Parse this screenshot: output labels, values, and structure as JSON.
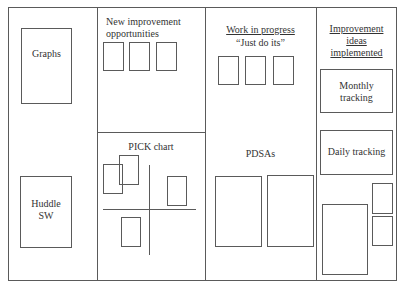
{
  "board": {
    "columns": [
      {
        "id": "col-1",
        "sections": [
          {
            "label": "Graphs"
          },
          {
            "label": "Huddle SW",
            "lines": [
              "Huddle",
              "SW"
            ]
          }
        ]
      },
      {
        "id": "col-2",
        "top": {
          "title_lines": [
            "New improvement",
            "opportunities"
          ],
          "card_count": 3
        },
        "bottom": {
          "title": "PICK chart",
          "card_count": 4
        }
      },
      {
        "id": "col-3",
        "top": {
          "title": "Work in progress",
          "subtitle": "“Just do its”",
          "card_count": 3
        },
        "bottom": {
          "title": "PDSAs",
          "card_count": 2
        }
      },
      {
        "id": "col-4",
        "title_lines": [
          "Improvement",
          "ideas",
          "implemented"
        ],
        "boxes": [
          {
            "lines": [
              "Monthly",
              "tracking"
            ]
          },
          {
            "label": "Daily tracking"
          }
        ],
        "card_count": 3
      }
    ]
  },
  "colors": {
    "line": "#5a5a5a",
    "text": "#333333",
    "background": "#ffffff"
  }
}
